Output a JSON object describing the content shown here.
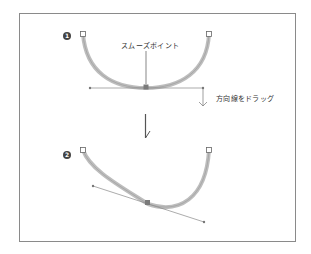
{
  "steps": [
    {
      "number": "1",
      "label_smooth_point": "スムーズポイント",
      "label_drag": "方向線をドラッグ"
    },
    {
      "number": "2"
    }
  ],
  "colors": {
    "path": "#b5b5b5",
    "path_inner": "#8c8c8c",
    "handle_line": "#888888",
    "anchor": "#777777",
    "frame": "#8a8a8a"
  }
}
